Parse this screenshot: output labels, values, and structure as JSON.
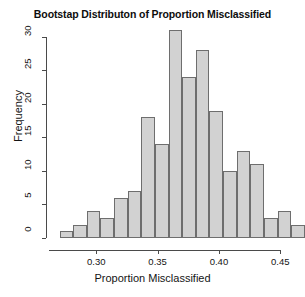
{
  "chart_data": {
    "type": "bar",
    "title": "Bootstap Distributon of Proportion Misclassified",
    "xlabel": "Proportion Misclassified",
    "ylabel": "Frequency",
    "subtitle": "",
    "grid": false,
    "legend": "none",
    "xlim": [
      0.2655,
      0.4555
    ],
    "ylim": [
      0,
      31
    ],
    "bin_width": 0.0111,
    "bin_starts": [
      0.27,
      0.2811,
      0.2922,
      0.3033,
      0.3144,
      0.3256,
      0.3367,
      0.3478,
      0.3589,
      0.37,
      0.3811,
      0.3922,
      0.4033,
      0.4144,
      0.4256,
      0.4367,
      0.4478,
      0.4589
    ],
    "categories": [
      "0.270",
      "0.281",
      "0.292",
      "0.303",
      "0.314",
      "0.326",
      "0.337",
      "0.348",
      "0.359",
      "0.370",
      "0.381",
      "0.392",
      "0.403",
      "0.414",
      "0.426",
      "0.437",
      "0.448",
      "0.459"
    ],
    "values": [
      1,
      2,
      4,
      3,
      6,
      7,
      18,
      14,
      31,
      24,
      28,
      19,
      10,
      13,
      11,
      3,
      4,
      2
    ],
    "x_ticks": [
      0.3,
      0.35,
      0.4,
      0.45
    ],
    "x_tick_labels": [
      "0.30",
      "0.35",
      "0.40",
      "0.45"
    ],
    "y_ticks": [
      0,
      5,
      10,
      15,
      20,
      25,
      30
    ],
    "y_tick_labels": [
      "0",
      "5",
      "10",
      "15",
      "20",
      "25",
      "30"
    ],
    "bar_fill_color": "#d2d2d2",
    "bar_border_color": "#6e6e6e",
    "axis_color": "#4a4a4a"
  }
}
